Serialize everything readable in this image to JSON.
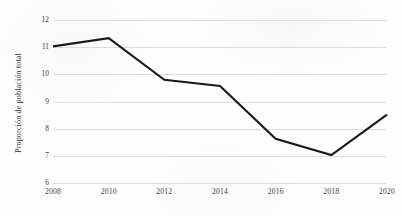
{
  "chart_data": {
    "type": "line",
    "title": "",
    "xlabel": "",
    "ylabel": "Proporción de población total",
    "x": [
      2008,
      2010,
      2012,
      2014,
      2016,
      2018,
      2020
    ],
    "categories": [
      "2008",
      "2010",
      "2012",
      "2014",
      "2016",
      "2018",
      "2020"
    ],
    "values": [
      11.03,
      11.33,
      9.8,
      9.57,
      7.63,
      7.03,
      8.52
    ],
    "series": [
      {
        "name": "Proporción de población total",
        "values": [
          11.03,
          11.33,
          9.8,
          9.57,
          7.63,
          7.03,
          8.52
        ]
      }
    ],
    "xlim": [
      2008,
      2020
    ],
    "ylim": [
      6,
      12
    ],
    "ytick_labels": [
      "12",
      "11",
      "10",
      "9",
      "8",
      "7",
      "6"
    ],
    "ytick_values": [
      12,
      11,
      10,
      9,
      8,
      7,
      6
    ],
    "xtick_labels": [
      "2008",
      "2010",
      "2012",
      "2014",
      "2016",
      "2018",
      "2020"
    ],
    "grid": "horizontal",
    "legend": "none",
    "line_color": "#1a1a1a",
    "grid_color": "#dcdcdc",
    "background_color": "#fefefe"
  }
}
